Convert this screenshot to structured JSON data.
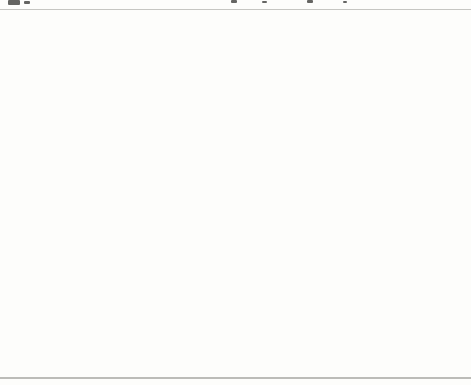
{
  "chart_data": {
    "type": "heatmap",
    "subtype": "us-state-choropleth",
    "unit": "dollars",
    "legend_position": "bottom",
    "legend_bins": [
      "$4,000–4,999",
      "$5,000–5,999",
      "$6,000–6,999",
      "$7,000–7,999",
      "$8,000–8,999",
      "$9,000–9,999",
      "$10,000–10,999"
    ],
    "categories": [
      "WA",
      "OR",
      "CA",
      "AK",
      "HI",
      "ID",
      "NV",
      "MT",
      "WY",
      "UT",
      "CO",
      "AZ",
      "NM",
      "ND",
      "SD",
      "NE",
      "KS",
      "OK",
      "TX",
      "MN",
      "IA",
      "MO",
      "AR",
      "LA",
      "WI",
      "IL",
      "MI",
      "IN",
      "OH",
      "KY",
      "TN",
      "MS",
      "AL",
      "GA",
      "FL",
      "SC",
      "NC",
      "VA",
      "WV",
      "PA",
      "NY",
      "VT",
      "NH",
      "ME",
      "MA",
      "RI",
      "CT",
      "NJ",
      "DE",
      "MD",
      "DC"
    ],
    "values": [
      6633,
      7592,
      5462,
      10611,
      6694,
      5366,
      6182,
      6704,
      7305,
      4059,
      5697,
      4918,
      5429,
      4704,
      5281,
      6404,
      6588,
      5593,
      6475,
      7424,
      6100,
      5614,
      5545,
      5757,
      7694,
      6404,
      8139,
      7207,
      6816,
      6662,
      5579,
      4658,
      4818,
      6296,
      6203,
      6005,
      6272,
      6550,
      7403,
      7716,
      9786,
      7904,
      6839,
      7584,
      7854,
      8239,
      9589,
      10420,
      8658,
      7553,
      7983
    ]
  },
  "figure": {
    "legend_title": "Spending Per Pupil",
    "bands": {
      "b4": "#b8b8b4",
      "b5": "#8f8f8b",
      "b6": "#a5a5a1",
      "b7": "#cccccb",
      "b8": "#b2b2ae",
      "b9": "#c6c6c3",
      "b10": "#4d4d4b"
    },
    "legend": [
      {
        "label": "$4,000–4,999",
        "band": "b4"
      },
      {
        "label": "$5,000–5,999",
        "band": "b5"
      },
      {
        "label": "$6,000–6,999",
        "band": "b6"
      },
      {
        "label": "$7,000–7,999",
        "band": "b7"
      },
      {
        "label": "$8,000–8,999",
        "band": "b8"
      },
      {
        "label": "$9,000–9,999",
        "band": "b9"
      },
      {
        "label": "$10,000–10,999",
        "band": "b10"
      }
    ],
    "states": [
      {
        "abbr": "WA",
        "value": "6,633",
        "band": "b6"
      },
      {
        "abbr": "OR",
        "value": "7,592",
        "band": "b7"
      },
      {
        "abbr": "CA",
        "value": "5,462",
        "band": "b5"
      },
      {
        "abbr": "AK",
        "value": "10,611",
        "band": "b10"
      },
      {
        "abbr": "HI",
        "value": "6,694",
        "band": "b6"
      },
      {
        "abbr": "ID",
        "value": "5,366",
        "band": "b5"
      },
      {
        "abbr": "NV",
        "value": "6,182",
        "band": "b6"
      },
      {
        "abbr": "MT",
        "value": "6,704",
        "band": "b6"
      },
      {
        "abbr": "WY",
        "value": "7,305",
        "band": "b7"
      },
      {
        "abbr": "UT",
        "value": "4,059",
        "band": "b4"
      },
      {
        "abbr": "CO",
        "value": "5,697",
        "band": "b5"
      },
      {
        "abbr": "AZ",
        "value": "4,918",
        "band": "b4"
      },
      {
        "abbr": "NM",
        "value": "5,429",
        "band": "b5"
      },
      {
        "abbr": "ND",
        "value": "4,704",
        "band": "b4"
      },
      {
        "abbr": "SD",
        "value": "5,281",
        "band": "b5"
      },
      {
        "abbr": "NE",
        "value": "6,404",
        "band": "b6"
      },
      {
        "abbr": "KS",
        "value": "6,588",
        "band": "b6"
      },
      {
        "abbr": "OK",
        "value": "5,593",
        "band": "b5"
      },
      {
        "abbr": "TX",
        "value": "6,475",
        "band": "b6"
      },
      {
        "abbr": "MN",
        "value": "7,424",
        "band": "b7"
      },
      {
        "abbr": "IA",
        "value": "6,100",
        "band": "b6"
      },
      {
        "abbr": "MO",
        "value": "5,614",
        "band": "b5"
      },
      {
        "abbr": "AR",
        "value": "5,545",
        "band": "b5"
      },
      {
        "abbr": "LA",
        "value": "5,757",
        "band": "b5"
      },
      {
        "abbr": "WI",
        "value": "7,694",
        "band": "b7"
      },
      {
        "abbr": "IL",
        "value": "6,404",
        "band": "b6"
      },
      {
        "abbr": "MI",
        "value": "8,139",
        "band": "b8"
      },
      {
        "abbr": "IN",
        "value": "7,207",
        "band": "b7"
      },
      {
        "abbr": "OH",
        "value": "6,816",
        "band": "b6"
      },
      {
        "abbr": "KY",
        "value": "6,662",
        "band": "b6"
      },
      {
        "abbr": "TN",
        "value": "5,579",
        "band": "b5"
      },
      {
        "abbr": "MS",
        "value": "4,658",
        "band": "b4"
      },
      {
        "abbr": "AL",
        "value": "4,818",
        "band": "b4"
      },
      {
        "abbr": "GA",
        "value": "6,296",
        "band": "b6"
      },
      {
        "abbr": "FL",
        "value": "6,203",
        "band": "b6"
      },
      {
        "abbr": "SC",
        "value": "6,005",
        "band": "b6"
      },
      {
        "abbr": "NC",
        "value": "6,272",
        "band": "b6"
      },
      {
        "abbr": "VA",
        "value": "6,550",
        "band": "b6"
      },
      {
        "abbr": "WV",
        "value": "7,403",
        "band": "b7"
      },
      {
        "abbr": "PA",
        "value": "7,716",
        "band": "b7"
      },
      {
        "abbr": "NY",
        "value": "9,786",
        "band": "b9"
      },
      {
        "abbr": "VT",
        "value": "7,904",
        "band": "b7"
      },
      {
        "abbr": "NH",
        "value": "6,839",
        "band": "b6"
      },
      {
        "abbr": "ME",
        "value": "7,584",
        "band": "b7"
      },
      {
        "abbr": "MA",
        "value": "7,854",
        "band": "b7"
      },
      {
        "abbr": "RI",
        "value": "8,239",
        "band": "b8"
      },
      {
        "abbr": "CT",
        "value": "9,589",
        "band": "b9"
      },
      {
        "abbr": "NJ",
        "value": "10,420",
        "band": "b10"
      },
      {
        "abbr": "DE",
        "value": "8,658",
        "band": "b8"
      },
      {
        "abbr": "MD",
        "value": "7,553",
        "band": "b7"
      },
      {
        "abbr": "DC",
        "value": "7,983",
        "band": "b7"
      }
    ],
    "callouts_top": [
      "NH",
      "VT"
    ],
    "callouts_right": [
      "MA",
      "RI",
      "CT",
      "NJ",
      "DE",
      "MD",
      "DC"
    ]
  }
}
